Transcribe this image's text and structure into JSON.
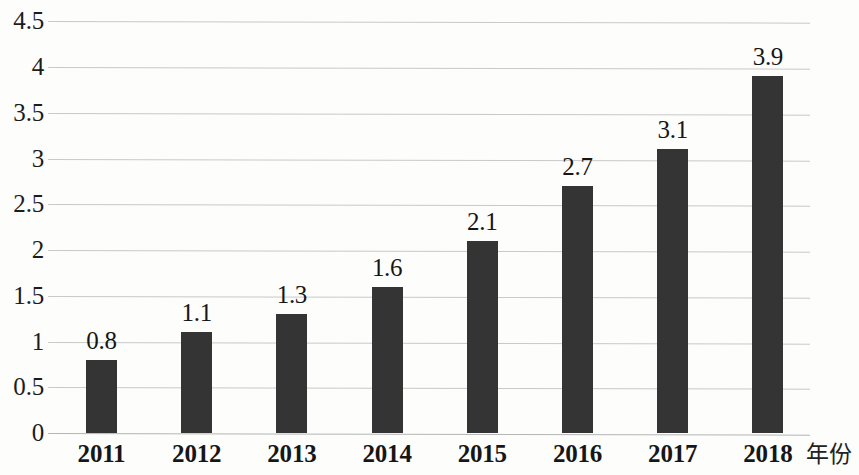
{
  "chart_data": {
    "type": "bar",
    "title": "",
    "subtitle": "",
    "xlabel": "年份",
    "ylabel": "",
    "categories": [
      "2011",
      "2012",
      "2013",
      "2014",
      "2015",
      "2016",
      "2017",
      "2018"
    ],
    "values": [
      0.8,
      1.1,
      1.3,
      1.6,
      2.1,
      2.7,
      3.1,
      3.9
    ],
    "data_labels": [
      "0.8",
      "1.1",
      "1.3",
      "1.6",
      "2.1",
      "2.7",
      "3.1",
      "3.9"
    ],
    "series": [
      {
        "name": "",
        "values": [
          0.8,
          1.1,
          1.3,
          1.6,
          2.1,
          2.7,
          3.1,
          3.9
        ]
      }
    ],
    "ylim": [
      0,
      4.5
    ],
    "y_ticks": [
      0,
      0.5,
      1,
      1.5,
      2,
      2.5,
      3,
      3.5,
      4,
      4.5
    ],
    "y_tick_labels": [
      "0",
      "0.5",
      "1",
      "1.5",
      "2",
      "2.5",
      "3",
      "3.5",
      "4",
      "4.5"
    ],
    "grid": true,
    "legend": false,
    "legend_position": "none",
    "bar_color": "#343434",
    "gridline_color": "#c9c9c9",
    "background_color": "#fdfdfc",
    "text_color": "#161616"
  }
}
